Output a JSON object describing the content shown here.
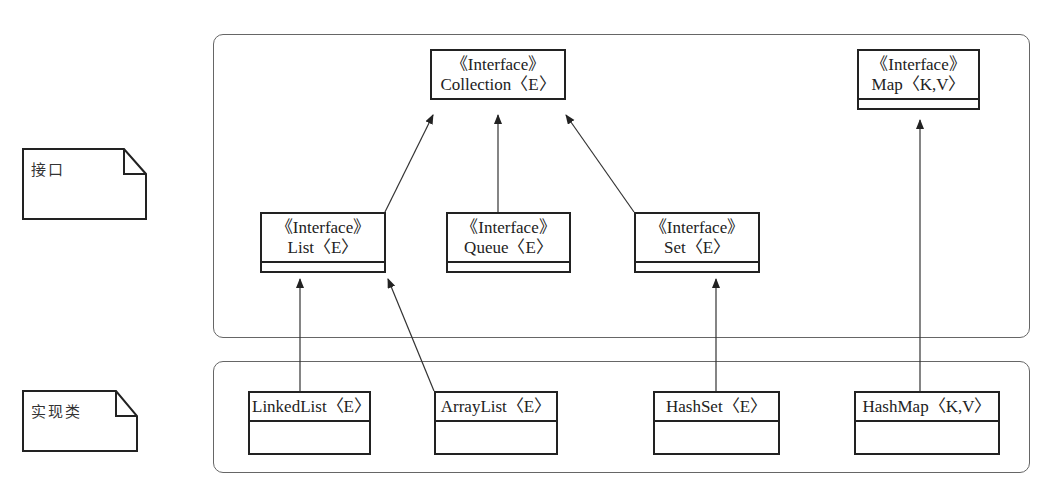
{
  "notes": {
    "interfaces": "接口",
    "implementations": "实现类"
  },
  "interfaces": {
    "collection": {
      "stereotype": "《Interface》",
      "name": "Collection〈E〉"
    },
    "map": {
      "stereotype": "《Interface》",
      "name": "Map〈K,V〉"
    },
    "list": {
      "stereotype": "《Interface》",
      "name": "List〈E〉"
    },
    "queue": {
      "stereotype": "《Interface》",
      "name": "Queue〈E〉"
    },
    "set": {
      "stereotype": "《Interface》",
      "name": "Set〈E〉"
    }
  },
  "classes": {
    "linkedlist": {
      "name": "LinkedList〈E〉"
    },
    "arraylist": {
      "name": "ArrayList〈E〉"
    },
    "hashset": {
      "name": "HashSet〈E〉"
    },
    "hashmap": {
      "name": "HashMap〈K,V〉"
    }
  },
  "relations": [
    {
      "from": "List",
      "to": "Collection",
      "type": "generalization"
    },
    {
      "from": "Queue",
      "to": "Collection",
      "type": "generalization"
    },
    {
      "from": "Set",
      "to": "Collection",
      "type": "generalization"
    },
    {
      "from": "LinkedList",
      "to": "List",
      "type": "realization"
    },
    {
      "from": "ArrayList",
      "to": "List",
      "type": "realization"
    },
    {
      "from": "HashSet",
      "to": "Set",
      "type": "realization"
    },
    {
      "from": "HashMap",
      "to": "Map",
      "type": "realization"
    }
  ]
}
